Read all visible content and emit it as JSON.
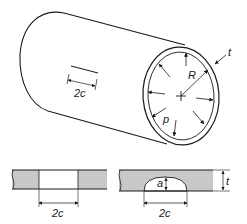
{
  "diagram": {
    "colors": {
      "stroke": "#1a1a1a",
      "hatch_fill": "#c8c8c8",
      "background": "#ffffff"
    },
    "labels": {
      "thickness": "t",
      "radius": "R",
      "pressure": "p",
      "crack_length_cylinder": "2c",
      "through_crack_length": "2c",
      "surface_crack_length": "2c",
      "surface_crack_depth": "a",
      "section_thickness": "t"
    },
    "parts": [
      {
        "id": "cylinder",
        "description": "Thin-walled cylinder under internal pressure p, radius R, wall thickness t"
      },
      {
        "id": "through-crack-section",
        "description": "Cross-section of through-thickness crack of length 2c"
      },
      {
        "id": "surface-crack-section",
        "description": "Cross-section of semi-elliptical surface crack, depth a, length 2c, wall thickness t"
      }
    ]
  }
}
